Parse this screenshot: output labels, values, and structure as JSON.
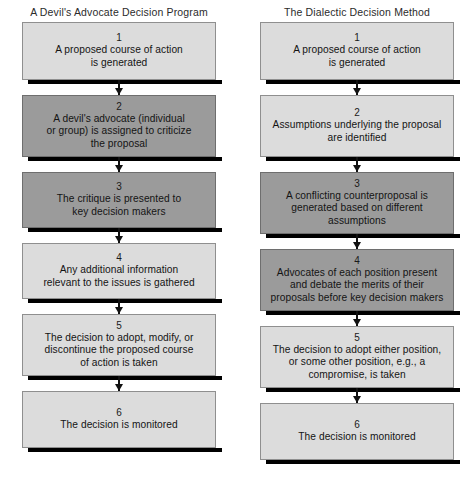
{
  "figure": {
    "background": "#ffffff",
    "shade_light": "#dcdcdc",
    "shade_dark": "#9b9b9b",
    "border_color": "#8f8f8f",
    "shadow_color": "#000000",
    "arrow_color": "#111111"
  },
  "columns": [
    {
      "title": "A Devil's Advocate Decision Program",
      "nodes": [
        {
          "number": "1",
          "text": "A proposed course of action\nis generated",
          "shade": "light",
          "height": 58
        },
        {
          "number": "2",
          "text": "A devil's advocate (individual\nor group) is assigned to criticize\nthe proposal",
          "shade": "dark",
          "height": 62
        },
        {
          "number": "3",
          "text": "The critique is presented to\nkey decision makers",
          "shade": "dark",
          "height": 56
        },
        {
          "number": "4",
          "text": "Any additional information\nrelevant to the issues is gathered",
          "shade": "light",
          "height": 56
        },
        {
          "number": "5",
          "text": "The decision to adopt, modify, or\ndiscontinue the proposed course\nof action is taken",
          "shade": "light",
          "height": 62
        },
        {
          "number": "6",
          "text": "The decision is monitored",
          "shade": "light",
          "height": 57
        }
      ]
    },
    {
      "title": "The Dialectic Decision Method",
      "nodes": [
        {
          "number": "1",
          "text": "A proposed course of action\nis generated",
          "shade": "light",
          "height": 58
        },
        {
          "number": "2",
          "text": "Assumptions underlying the proposal\nare identified",
          "shade": "light",
          "height": 62
        },
        {
          "number": "3",
          "text": "A conflicting counterproposal is\ngenerated based on different\nassumptions",
          "shade": "dark",
          "height": 62
        },
        {
          "number": "4",
          "text": "Advocates of each position present\nand debate the merits of their\nproposals before key decision makers",
          "shade": "dark",
          "height": 62
        },
        {
          "number": "5",
          "text": "The decision to adopt either position,\nor some other position, e.g., a\ncompromise, is taken",
          "shade": "light",
          "height": 62
        },
        {
          "number": "6",
          "text": "The decision is monitored",
          "shade": "light",
          "height": 57
        }
      ]
    }
  ],
  "connector": {
    "shaft_height": 15,
    "count": 5
  }
}
